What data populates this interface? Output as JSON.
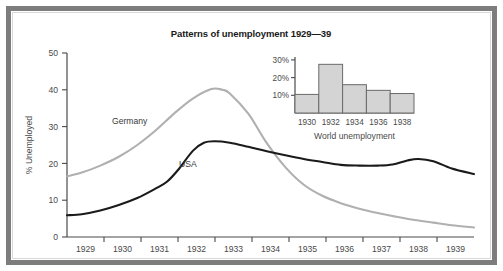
{
  "figure": {
    "title": "Patterns of unemployment 1929—39",
    "background_color": "#ffffff",
    "frame_color": "#7d7d7d"
  },
  "chart_data": {
    "type": "line",
    "title": "Patterns of unemployment 1929—39",
    "xlabel": "",
    "ylabel": "% Unemployed",
    "xlim": [
      1928.6,
      1939.6
    ],
    "ylim": [
      0,
      50
    ],
    "xticks": [
      "1929",
      "1930",
      "1931",
      "1932",
      "1933",
      "1934",
      "1935",
      "1936",
      "1937",
      "1938",
      "1939"
    ],
    "yticks": [
      "0",
      "10",
      "20",
      "30",
      "40",
      "50"
    ],
    "grid": false,
    "legend_position": "inline-annotation",
    "series": [
      {
        "name": "Germany",
        "color": "#b0b0b0",
        "label_text": "Germany",
        "x": [
          1928.6,
          1929.0,
          1929.5,
          1930.0,
          1930.5,
          1931.0,
          1931.5,
          1932.0,
          1932.5,
          1932.8,
          1933.0,
          1933.5,
          1934.0,
          1934.5,
          1935.0,
          1935.5,
          1936.0,
          1936.5,
          1937.0,
          1937.5,
          1938.0,
          1938.5,
          1939.0,
          1939.6
        ],
        "y": [
          16.5,
          17.5,
          19.4,
          21.8,
          25.0,
          29.0,
          33.6,
          37.6,
          40.2,
          40.0,
          39.0,
          33.5,
          25.5,
          19.0,
          14.2,
          11.2,
          9.2,
          7.7,
          6.5,
          5.5,
          4.6,
          3.9,
          3.2,
          2.6
        ]
      },
      {
        "name": "USA",
        "color": "#1a1a1a",
        "label_text": "USA",
        "x": [
          1928.6,
          1929.0,
          1929.5,
          1930.0,
          1930.5,
          1931.0,
          1931.3,
          1931.6,
          1932.0,
          1932.3,
          1932.6,
          1933.0,
          1933.5,
          1934.0,
          1934.5,
          1935.0,
          1935.5,
          1936.0,
          1936.5,
          1937.0,
          1937.4,
          1937.8,
          1938.1,
          1938.5,
          1939.0,
          1939.6
        ],
        "y": [
          5.9,
          6.2,
          7.2,
          8.7,
          10.6,
          13.2,
          15.0,
          18.2,
          23.4,
          25.6,
          26.0,
          25.6,
          24.5,
          23.3,
          22.2,
          21.2,
          20.4,
          19.6,
          19.4,
          19.4,
          19.7,
          20.8,
          21.2,
          20.6,
          18.6,
          17.1
        ]
      }
    ]
  },
  "inset_chart": {
    "type": "bar",
    "title": "World unemployment",
    "xlabel": "World unemployment",
    "ylabel": "",
    "ylim": [
      0,
      32
    ],
    "yticks": [
      "10%",
      "20%",
      "30%"
    ],
    "ytick_values": [
      10,
      20,
      30
    ],
    "categories": [
      "1930",
      "1932",
      "1934",
      "1936",
      "1938"
    ],
    "values": [
      10.5,
      27.5,
      16.0,
      12.8,
      11.0
    ],
    "bar_fill_color": "#d4d4d4",
    "bar_edge_color": "#6a6a6a",
    "grid": false
  }
}
